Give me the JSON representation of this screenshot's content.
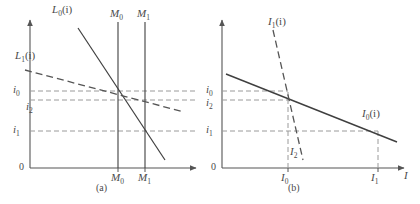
{
  "figure": {
    "background": "#ffffff",
    "axis_color": "#555555",
    "solid_curve_color": "#3f3f3f",
    "dashed_curve_color": "#555555",
    "guide_color": "#9a9a9a"
  },
  "panel_a": {
    "caption": "(a)",
    "origin_label": "0",
    "curves": [
      {
        "name": "L0",
        "label_main": "L",
        "label_sub": "0",
        "label_arg": "(i)",
        "style": "solid"
      },
      {
        "name": "L1",
        "label_main": "L",
        "label_sub": "1",
        "label_arg": "(i)",
        "style": "dashed"
      }
    ],
    "vertical_lines": [
      {
        "name": "M0",
        "label_main": "M",
        "label_sub": "0"
      },
      {
        "name": "M1",
        "label_main": "M",
        "label_sub": "1"
      }
    ],
    "y_ticks": [
      {
        "name": "i0",
        "label_main": "i",
        "label_sub": "0"
      },
      {
        "name": "i2",
        "label_main": "i",
        "label_sub": "2"
      },
      {
        "name": "i1",
        "label_main": "i",
        "label_sub": "1"
      }
    ],
    "x_ticks": [
      {
        "name": "M0",
        "label_main": "M",
        "label_sub": "0"
      },
      {
        "name": "M1",
        "label_main": "M",
        "label_sub": "1"
      }
    ]
  },
  "panel_b": {
    "caption": "(b)",
    "origin_label": "0",
    "x_axis_label": "I",
    "curves": [
      {
        "name": "I0",
        "label_main": "I",
        "label_sub": "0",
        "label_arg": "(i)",
        "style": "solid"
      },
      {
        "name": "I1",
        "label_main": "I",
        "label_sub": "1",
        "label_arg": "(i)",
        "style": "dashed"
      }
    ],
    "y_ticks": [
      {
        "name": "i0",
        "label_main": "i",
        "label_sub": "0"
      },
      {
        "name": "i2",
        "label_main": "i",
        "label_sub": "2"
      },
      {
        "name": "i1",
        "label_main": "i",
        "label_sub": "1"
      }
    ],
    "x_ticks": [
      {
        "name": "I0",
        "label_main": "I",
        "label_sub": "0"
      },
      {
        "name": "I2",
        "label_main": "I",
        "label_sub": "2"
      },
      {
        "name": "I1",
        "label_main": "I",
        "label_sub": "1"
      }
    ]
  }
}
